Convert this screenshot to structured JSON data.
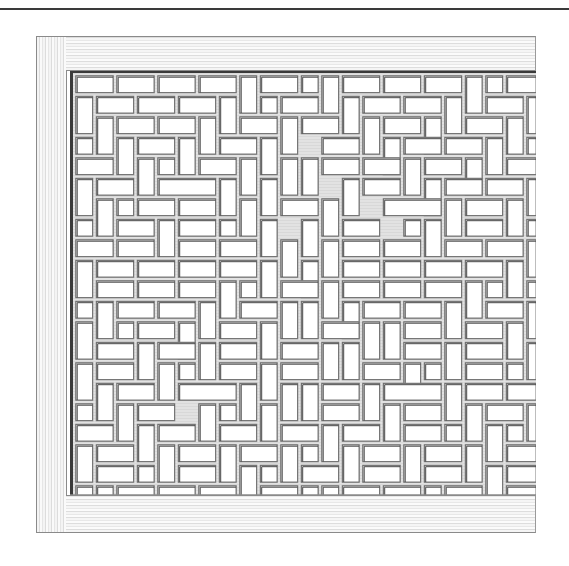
{
  "figure": {
    "colors": {
      "background": "#ffffff",
      "strip": "#e2e2e2",
      "strip_shadow": "#6e6e6e",
      "opening": "#ffffff",
      "frame_edge": "#3a3a3a"
    },
    "grid": {
      "pitch": 20.5,
      "cols": 23,
      "rows": 21,
      "strip_width": 4
    },
    "openings": [
      [
        0,
        0,
        2,
        1
      ],
      [
        2,
        0,
        2,
        1
      ],
      [
        4,
        0,
        2,
        1
      ],
      [
        6,
        0,
        2,
        1
      ],
      [
        8,
        0,
        1,
        2
      ],
      [
        9,
        0,
        2,
        1
      ],
      [
        11,
        0,
        1,
        1
      ],
      [
        12,
        0,
        1,
        2
      ],
      [
        13,
        0,
        2,
        1
      ],
      [
        15,
        0,
        2,
        1
      ],
      [
        17,
        0,
        2,
        1
      ],
      [
        19,
        0,
        1,
        2
      ],
      [
        20,
        0,
        1,
        1
      ],
      [
        21,
        0,
        2,
        1
      ],
      [
        0,
        1,
        1,
        2
      ],
      [
        1,
        1,
        2,
        1
      ],
      [
        3,
        1,
        2,
        1
      ],
      [
        5,
        1,
        2,
        1
      ],
      [
        7,
        1,
        1,
        2
      ],
      [
        9,
        1,
        1,
        1
      ],
      [
        10,
        1,
        2,
        1
      ],
      [
        13,
        1,
        1,
        2
      ],
      [
        14,
        1,
        2,
        1
      ],
      [
        16,
        1,
        2,
        1
      ],
      [
        18,
        1,
        1,
        2
      ],
      [
        20,
        1,
        2,
        1
      ],
      [
        22,
        1,
        1,
        2
      ],
      [
        1,
        2,
        1,
        2
      ],
      [
        2,
        2,
        2,
        1
      ],
      [
        4,
        2,
        2,
        1
      ],
      [
        6,
        2,
        1,
        2
      ],
      [
        8,
        2,
        2,
        1
      ],
      [
        10,
        2,
        1,
        2
      ],
      [
        11,
        2,
        2,
        1
      ],
      [
        14,
        2,
        1,
        2
      ],
      [
        15,
        2,
        2,
        1
      ],
      [
        17,
        2,
        1,
        2
      ],
      [
        19,
        2,
        2,
        1
      ],
      [
        21,
        2,
        1,
        2
      ],
      [
        0,
        3,
        1,
        1
      ],
      [
        2,
        3,
        1,
        2
      ],
      [
        3,
        3,
        2,
        1
      ],
      [
        5,
        3,
        1,
        2
      ],
      [
        7,
        3,
        2,
        1
      ],
      [
        9,
        3,
        1,
        2
      ],
      [
        12,
        3,
        2,
        1
      ],
      [
        15,
        3,
        1,
        2
      ],
      [
        16,
        3,
        2,
        1
      ],
      [
        18,
        3,
        2,
        1
      ],
      [
        20,
        3,
        1,
        2
      ],
      [
        22,
        3,
        1,
        1
      ],
      [
        0,
        4,
        2,
        1
      ],
      [
        3,
        4,
        1,
        2
      ],
      [
        4,
        4,
        1,
        1
      ],
      [
        6,
        4,
        2,
        1
      ],
      [
        8,
        4,
        1,
        2
      ],
      [
        10,
        4,
        1,
        2
      ],
      [
        11,
        4,
        1,
        2
      ],
      [
        12,
        4,
        2,
        1
      ],
      [
        14,
        4,
        2,
        1
      ],
      [
        16,
        4,
        1,
        2
      ],
      [
        17,
        4,
        2,
        1
      ],
      [
        19,
        4,
        1,
        2
      ],
      [
        21,
        4,
        2,
        1
      ],
      [
        0,
        5,
        1,
        2
      ],
      [
        1,
        5,
        2,
        1
      ],
      [
        4,
        5,
        3,
        1
      ],
      [
        7,
        5,
        1,
        2
      ],
      [
        9,
        5,
        1,
        2
      ],
      [
        13,
        5,
        1,
        2
      ],
      [
        14,
        5,
        2,
        1
      ],
      [
        17,
        5,
        1,
        2
      ],
      [
        18,
        5,
        2,
        1
      ],
      [
        20,
        5,
        2,
        1
      ],
      [
        22,
        5,
        1,
        2
      ],
      [
        1,
        6,
        1,
        2
      ],
      [
        2,
        6,
        1,
        1
      ],
      [
        3,
        6,
        2,
        1
      ],
      [
        5,
        6,
        2,
        1
      ],
      [
        8,
        6,
        1,
        2
      ],
      [
        10,
        6,
        2,
        1
      ],
      [
        12,
        6,
        1,
        2
      ],
      [
        15,
        6,
        3,
        1
      ],
      [
        18,
        6,
        1,
        2
      ],
      [
        19,
        6,
        2,
        1
      ],
      [
        21,
        6,
        1,
        2
      ],
      [
        0,
        7,
        1,
        1
      ],
      [
        2,
        7,
        2,
        1
      ],
      [
        4,
        7,
        1,
        2
      ],
      [
        5,
        7,
        2,
        1
      ],
      [
        7,
        7,
        1,
        1
      ],
      [
        9,
        7,
        1,
        2
      ],
      [
        11,
        7,
        1,
        2
      ],
      [
        13,
        7,
        2,
        1
      ],
      [
        16,
        7,
        1,
        1
      ],
      [
        17,
        7,
        1,
        2
      ],
      [
        19,
        7,
        2,
        1
      ],
      [
        22,
        7,
        1,
        1
      ],
      [
        0,
        8,
        2,
        1
      ],
      [
        2,
        8,
        2,
        1
      ],
      [
        5,
        8,
        2,
        1
      ],
      [
        7,
        8,
        2,
        1
      ],
      [
        10,
        8,
        1,
        2
      ],
      [
        12,
        8,
        1,
        2
      ],
      [
        13,
        8,
        2,
        1
      ],
      [
        15,
        8,
        2,
        1
      ],
      [
        18,
        8,
        2,
        1
      ],
      [
        20,
        8,
        2,
        1
      ],
      [
        22,
        8,
        1,
        2
      ],
      [
        0,
        9,
        1,
        2
      ],
      [
        1,
        9,
        2,
        1
      ],
      [
        3,
        9,
        2,
        1
      ],
      [
        5,
        9,
        2,
        1
      ],
      [
        7,
        9,
        2,
        1
      ],
      [
        9,
        9,
        1,
        2
      ],
      [
        11,
        9,
        1,
        2
      ],
      [
        13,
        9,
        2,
        1
      ],
      [
        15,
        9,
        2,
        1
      ],
      [
        17,
        9,
        2,
        1
      ],
      [
        19,
        9,
        2,
        1
      ],
      [
        21,
        9,
        1,
        2
      ],
      [
        1,
        10,
        2,
        1
      ],
      [
        3,
        10,
        2,
        1
      ],
      [
        5,
        10,
        2,
        1
      ],
      [
        7,
        10,
        1,
        2
      ],
      [
        8,
        10,
        1,
        1
      ],
      [
        10,
        10,
        2,
        1
      ],
      [
        12,
        10,
        1,
        2
      ],
      [
        13,
        10,
        2,
        1
      ],
      [
        15,
        10,
        2,
        1
      ],
      [
        17,
        10,
        2,
        1
      ],
      [
        19,
        10,
        1,
        2
      ],
      [
        20,
        10,
        1,
        1
      ],
      [
        22,
        10,
        1,
        1
      ],
      [
        0,
        11,
        1,
        1
      ],
      [
        1,
        11,
        1,
        2
      ],
      [
        2,
        11,
        2,
        1
      ],
      [
        4,
        11,
        2,
        1
      ],
      [
        6,
        11,
        1,
        2
      ],
      [
        8,
        11,
        2,
        1
      ],
      [
        10,
        11,
        1,
        2
      ],
      [
        11,
        11,
        1,
        2
      ],
      [
        13,
        11,
        1,
        2
      ],
      [
        14,
        11,
        2,
        1
      ],
      [
        16,
        11,
        2,
        1
      ],
      [
        18,
        11,
        1,
        2
      ],
      [
        20,
        11,
        2,
        1
      ],
      [
        22,
        11,
        1,
        2
      ],
      [
        0,
        12,
        1,
        2
      ],
      [
        2,
        12,
        1,
        1
      ],
      [
        3,
        12,
        2,
        1
      ],
      [
        5,
        12,
        1,
        2
      ],
      [
        7,
        12,
        2,
        1
      ],
      [
        9,
        12,
        1,
        2
      ],
      [
        12,
        12,
        2,
        1
      ],
      [
        14,
        12,
        1,
        2
      ],
      [
        15,
        12,
        1,
        2
      ],
      [
        16,
        12,
        2,
        1
      ],
      [
        19,
        12,
        2,
        1
      ],
      [
        21,
        12,
        1,
        2
      ],
      [
        1,
        13,
        2,
        1
      ],
      [
        3,
        13,
        1,
        2
      ],
      [
        4,
        13,
        2,
        1
      ],
      [
        6,
        13,
        1,
        2
      ],
      [
        7,
        13,
        2,
        1
      ],
      [
        10,
        13,
        2,
        1
      ],
      [
        12,
        13,
        1,
        2
      ],
      [
        13,
        13,
        1,
        2
      ],
      [
        16,
        13,
        2,
        1
      ],
      [
        18,
        13,
        1,
        2
      ],
      [
        19,
        13,
        2,
        1
      ],
      [
        22,
        13,
        1,
        2
      ],
      [
        0,
        14,
        1,
        2
      ],
      [
        1,
        14,
        2,
        1
      ],
      [
        4,
        14,
        1,
        2
      ],
      [
        5,
        14,
        1,
        1
      ],
      [
        7,
        14,
        2,
        1
      ],
      [
        9,
        14,
        1,
        2
      ],
      [
        10,
        14,
        2,
        1
      ],
      [
        14,
        14,
        2,
        1
      ],
      [
        16,
        14,
        1,
        2
      ],
      [
        17,
        14,
        1,
        1
      ],
      [
        19,
        14,
        2,
        1
      ],
      [
        21,
        14,
        1,
        1
      ],
      [
        1,
        15,
        1,
        2
      ],
      [
        2,
        15,
        2,
        1
      ],
      [
        5,
        15,
        3,
        1
      ],
      [
        8,
        15,
        1,
        2
      ],
      [
        10,
        15,
        1,
        2
      ],
      [
        11,
        15,
        1,
        2
      ],
      [
        12,
        15,
        2,
        1
      ],
      [
        14,
        15,
        1,
        2
      ],
      [
        15,
        15,
        3,
        1
      ],
      [
        18,
        15,
        1,
        2
      ],
      [
        19,
        15,
        2,
        1
      ],
      [
        21,
        15,
        2,
        1
      ],
      [
        0,
        16,
        1,
        1
      ],
      [
        2,
        16,
        1,
        2
      ],
      [
        3,
        16,
        2,
        1
      ],
      [
        6,
        16,
        1,
        2
      ],
      [
        7,
        16,
        1,
        1
      ],
      [
        9,
        16,
        1,
        2
      ],
      [
        12,
        16,
        2,
        1
      ],
      [
        15,
        16,
        1,
        2
      ],
      [
        16,
        16,
        2,
        1
      ],
      [
        19,
        16,
        1,
        2
      ],
      [
        20,
        16,
        2,
        1
      ],
      [
        22,
        16,
        1,
        2
      ],
      [
        0,
        17,
        2,
        1
      ],
      [
        3,
        17,
        1,
        2
      ],
      [
        4,
        17,
        2,
        1
      ],
      [
        7,
        17,
        2,
        1
      ],
      [
        10,
        17,
        2,
        1
      ],
      [
        12,
        17,
        1,
        2
      ],
      [
        13,
        17,
        2,
        1
      ],
      [
        16,
        17,
        2,
        1
      ],
      [
        18,
        17,
        1,
        1
      ],
      [
        20,
        17,
        1,
        2
      ],
      [
        21,
        17,
        1,
        1
      ],
      [
        0,
        18,
        1,
        2
      ],
      [
        1,
        18,
        2,
        1
      ],
      [
        4,
        18,
        1,
        2
      ],
      [
        5,
        18,
        2,
        1
      ],
      [
        7,
        18,
        1,
        2
      ],
      [
        8,
        18,
        2,
        1
      ],
      [
        10,
        18,
        1,
        2
      ],
      [
        11,
        18,
        1,
        1
      ],
      [
        13,
        18,
        1,
        2
      ],
      [
        14,
        18,
        2,
        1
      ],
      [
        16,
        18,
        1,
        2
      ],
      [
        17,
        18,
        2,
        1
      ],
      [
        19,
        18,
        1,
        2
      ],
      [
        21,
        18,
        2,
        1
      ],
      [
        1,
        19,
        2,
        1
      ],
      [
        3,
        19,
        1,
        1
      ],
      [
        5,
        19,
        2,
        1
      ],
      [
        8,
        19,
        1,
        2
      ],
      [
        9,
        19,
        1,
        1
      ],
      [
        11,
        19,
        2,
        1
      ],
      [
        14,
        19,
        2,
        1
      ],
      [
        17,
        19,
        2,
        1
      ],
      [
        20,
        19,
        1,
        2
      ],
      [
        21,
        19,
        2,
        1
      ],
      [
        0,
        20,
        1,
        1
      ],
      [
        1,
        20,
        1,
        1
      ],
      [
        2,
        20,
        2,
        1
      ],
      [
        4,
        20,
        2,
        1
      ],
      [
        6,
        20,
        2,
        1
      ],
      [
        9,
        20,
        2,
        1
      ],
      [
        11,
        20,
        1,
        1
      ],
      [
        12,
        20,
        1,
        1
      ],
      [
        13,
        20,
        2,
        1
      ],
      [
        15,
        20,
        2,
        1
      ],
      [
        17,
        20,
        1,
        1
      ],
      [
        18,
        20,
        2,
        1
      ],
      [
        21,
        20,
        2,
        1
      ]
    ]
  }
}
